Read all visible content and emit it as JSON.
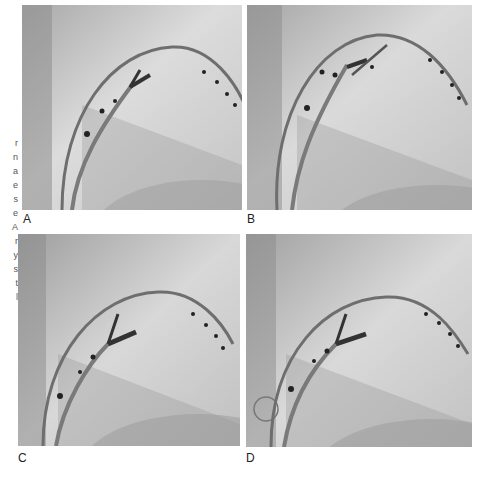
{
  "figure": {
    "left_margin_text_fragments": [
      "r",
      "n",
      "a",
      "e",
      "s",
      "e",
      "A",
      "r",
      "y",
      "s",
      "t",
      "l"
    ],
    "panels": [
      {
        "id": "A",
        "label": "A",
        "description": "Fluoroscopic image: curved catheter arc with electrodes and a branching electrode catheter"
      },
      {
        "id": "B",
        "label": "B",
        "description": "Fluoroscopic image: curved catheter arc with electrodes and parallel electrode catheters"
      },
      {
        "id": "C",
        "label": "C",
        "description": "Fluoroscopic image: curved catheter arc with Y-shaped branching electrode catheter"
      },
      {
        "id": "D",
        "label": "D",
        "description": "Fluoroscopic image: curved catheter arc with branching electrode catheter"
      }
    ]
  }
}
